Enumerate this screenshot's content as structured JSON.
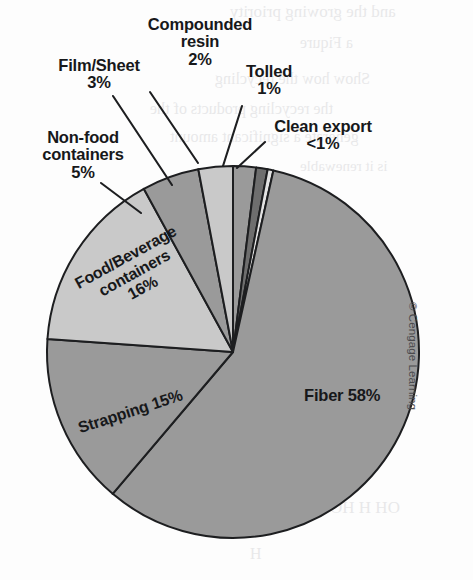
{
  "figure": {
    "copyright": "© Cengage Learning"
  },
  "chart_data": {
    "type": "pie",
    "title": "",
    "subtitle": "",
    "xlabel": "",
    "ylabel": "",
    "legend_position": "none",
    "grid": false,
    "total_percent": 100,
    "start_angle_deg": 0,
    "direction": "clockwise",
    "categories": [
      "Compounded resin",
      "Tolled",
      "Clean export",
      "Fiber",
      "Strapping",
      "Food/Beverage containers",
      "Non-food containers",
      "Film/Sheet"
    ],
    "values": [
      2,
      1,
      0.5,
      58,
      15,
      16,
      5,
      3
    ],
    "value_labels": [
      "2%",
      "1%",
      "<1%",
      "58%",
      "15%",
      "16%",
      "5%",
      "3%"
    ],
    "colors": [
      "#9a9a9a",
      "#6e6e6e",
      "#e3e3e3",
      "#9a9a9a",
      "#9a9a9a",
      "#c9c9c9",
      "#9a9a9a",
      "#c9c9c9"
    ],
    "slices": [
      {
        "name": "Compounded resin",
        "value": 2,
        "label": "Compounded resin",
        "value_label": "2%",
        "color": "#9a9a9a",
        "label_style": "callout"
      },
      {
        "name": "Tolled",
        "value": 1,
        "label": "Tolled",
        "value_label": "1%",
        "color": "#6e6e6e",
        "label_style": "callout"
      },
      {
        "name": "Clean export",
        "value": 0.5,
        "label": "Clean export",
        "value_label": "<1%",
        "color": "#e3e3e3",
        "label_style": "callout"
      },
      {
        "name": "Fiber",
        "value": 58,
        "label": "Fiber",
        "value_label": "58%",
        "color": "#9a9a9a",
        "label_style": "inside"
      },
      {
        "name": "Strapping",
        "value": 15,
        "label": "Strapping",
        "value_label": "15%",
        "color": "#9a9a9a",
        "label_style": "inside"
      },
      {
        "name": "Food/Beverage containers",
        "value": 16,
        "label": "Food/Beverage containers",
        "value_label": "16%",
        "color": "#c9c9c9",
        "label_style": "inside"
      },
      {
        "name": "Non-food containers",
        "value": 5,
        "label": "Non-food containers",
        "value_label": "5%",
        "color": "#9a9a9a",
        "label_style": "callout"
      },
      {
        "name": "Film/Sheet",
        "value": 3,
        "label": "Film/Sheet",
        "value_label": "3%",
        "color": "#c9c9c9",
        "label_style": "callout"
      }
    ]
  },
  "callouts": {
    "compounded_resin": {
      "line1": "Compounded",
      "line2": "resin",
      "line3": "2%"
    },
    "film_sheet": {
      "line1": "Film/Sheet",
      "line2": "3%"
    },
    "tolled": {
      "line1": "Tolled",
      "line2": "1%"
    },
    "clean_export": {
      "line1": "Clean export",
      "line2": "<1%"
    },
    "non_food": {
      "line1": "Non-food",
      "line2": "containers",
      "line3": "5%"
    }
  },
  "inside_labels": {
    "fiber": "Fiber 58%",
    "food_bev_line1": "Food/Beverage",
    "food_bev_line2": "containers",
    "food_bev_line3": "16%",
    "strapping": "Strapping 15%"
  },
  "ghost_text": [
    "and the growing priority",
    "a Fiqure",
    "Show how the recycling",
    "the recycling products of the",
    "generate a significant amount",
    "is it renewable",
    "OH    H      HO",
    "H"
  ]
}
